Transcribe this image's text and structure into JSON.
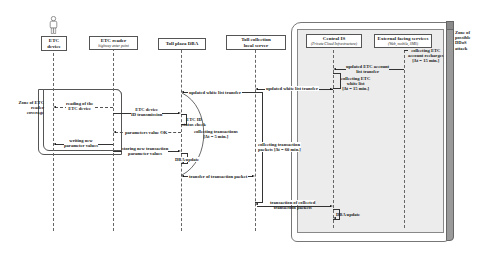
{
  "actors": [
    {
      "name": "ETC device",
      "line1": "ETC",
      "line2": "device",
      "sub": ""
    },
    {
      "name": "ETC reader",
      "line1": "ETC reader",
      "line2": "",
      "sub": "highway enter point"
    },
    {
      "name": "Toll plaza DBA",
      "line1": "Toll plaza DBA",
      "line2": "",
      "sub": ""
    },
    {
      "name": "Toll collection local server",
      "line1": "Toll collection",
      "line2": "local server",
      "sub": ""
    },
    {
      "name": "Central IS",
      "line1": "Central IS",
      "line2": "",
      "sub": "(Private Cloud Infrastructure)"
    },
    {
      "name": "External facing services",
      "line1": "External facing services",
      "line2": "",
      "sub": "(Web, mobile, SMS)"
    }
  ],
  "zones": {
    "reader_coverage": {
      "line1": "Zone of ETC",
      "line2": "reader",
      "line3": "coverage"
    },
    "ddos": {
      "line1": "Zone of",
      "line2": "possible",
      "line3": "DDoS",
      "line4": "attack"
    }
  },
  "messages": {
    "collecting_account": {
      "line1": "collecting ETC",
      "line2": "account recharges",
      "line3": "[Δt = 15 min.]"
    },
    "updated_account": {
      "line1": "updated ETC account",
      "line2": "list transfer"
    },
    "collecting_whitelist": {
      "line1": "collecting ETC",
      "line2": "white list",
      "line3": "[Δt = 15 min.]"
    },
    "updated_white_central": "updated white list transfer",
    "updated_white_plaza": "updated white list transfer",
    "reading_device": {
      "line1": "reading of the",
      "line2": "ETC device"
    },
    "device_id": {
      "line1": "ETC device",
      "line2": "ID transmission"
    },
    "id_check": {
      "line1": "ETC ID",
      "line2": "status check"
    },
    "collecting_tx": {
      "line1": "collecting transactions",
      "line2": "[Δt = 5 min.]"
    },
    "param_ok": "parameters value OK",
    "writing_params": {
      "line1": "writing new",
      "line2": "parameter values"
    },
    "storing_tx": {
      "line1": "storing new transaction",
      "line2": "parameter values"
    },
    "dba_update_plaza": "DBA update",
    "collecting_packets": {
      "line1": "collecting transaction",
      "line2": "packets [Δt = 60 min.]"
    },
    "transfer_packet": "transfer of transaction packet",
    "transaction_collected": {
      "line1": "transaction of collected",
      "line2": "transaction packets"
    },
    "dba_update_central": "DBA update"
  },
  "colors": {
    "zone_fill": "#ececec",
    "ddos_bar": "#9a9a9a",
    "line": "#333333"
  }
}
